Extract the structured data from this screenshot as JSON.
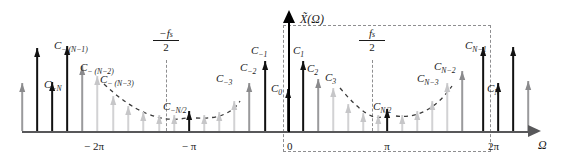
{
  "figure": {
    "type": "spectrum-line-diagram",
    "y_axis_label": "X̃(Ω)",
    "x_axis_label": "Ω"
  },
  "axis": {
    "x_ticks": [
      {
        "name": "minus-two-pi",
        "label": "− 2π",
        "x": 94
      },
      {
        "name": "minus-pi",
        "label": "− π",
        "x": 189
      },
      {
        "name": "zero",
        "label": "0",
        "x": 288
      },
      {
        "name": "pi",
        "label": "π",
        "x": 387
      },
      {
        "name": "two-pi",
        "label": "2π",
        "x": 489
      }
    ]
  },
  "markers": {
    "neg_fs_half": {
      "numerator": "−f",
      "numerator_sub": "s",
      "denominator": "2",
      "x": 166,
      "label": "-fs/2"
    },
    "pos_fs_half": {
      "numerator": "f",
      "numerator_sub": "s",
      "denominator": "2",
      "x": 372,
      "label": "fs/2"
    }
  },
  "chart_data": {
    "type": "bar",
    "title": "",
    "xlabel": "Ω",
    "ylabel": "X̃(Ω)",
    "grid": false,
    "legend": null,
    "xlim": [
      -2.6,
      2.45
    ],
    "note": "Heights are impulse amplitudes in pixels above the frequency axis; shade denotes drawing emphasis (dark = labelled line, light = faded line).",
    "impulses": [
      {
        "x": 22,
        "h": 48,
        "shade": "mid",
        "label": ""
      },
      {
        "x": 37,
        "h": 83,
        "shade": "dark",
        "label": ""
      },
      {
        "x": 52,
        "h": 49,
        "shade": "dark",
        "label": "C₋ₙ",
        "label_text": "C",
        "label_sub": "−N"
      },
      {
        "x": 67,
        "h": 85,
        "shade": "dark",
        "label": "C−(N−1)",
        "label_text": "C",
        "label_sub": "− (N−1)"
      },
      {
        "x": 82,
        "h": 65,
        "shade": "mid",
        "label": "C−(N−2)",
        "label_text": "C",
        "label_sub": "− (N−2)"
      },
      {
        "x": 97,
        "h": 55,
        "shade": "light",
        "label": "C−(N−3)",
        "label_text": "C",
        "label_sub": "− (N−3)"
      },
      {
        "x": 113,
        "h": 35,
        "shade": "light",
        "label": ""
      },
      {
        "x": 128,
        "h": 25,
        "shade": "light",
        "label": ""
      },
      {
        "x": 143,
        "h": 19,
        "shade": "light",
        "label": ""
      },
      {
        "x": 159,
        "h": 16,
        "shade": "light",
        "label": ""
      },
      {
        "x": 174,
        "h": 16,
        "shade": "light",
        "label": ""
      },
      {
        "x": 189,
        "h": 20,
        "shade": "dark",
        "label": "C−N/2",
        "label_text": "C",
        "label_sub": "−N/2"
      },
      {
        "x": 204,
        "h": 16,
        "shade": "light",
        "label": ""
      },
      {
        "x": 219,
        "h": 19,
        "shade": "light",
        "label": ""
      },
      {
        "x": 234,
        "h": 30,
        "shade": "light",
        "label": "C−3",
        "label_text": "C",
        "label_sub": "−3"
      },
      {
        "x": 249,
        "h": 48,
        "shade": "mid",
        "label": "C−2",
        "label_text": "C",
        "label_sub": "−2"
      },
      {
        "x": 265,
        "h": 70,
        "shade": "dark",
        "label": "C−1",
        "label_text": "C",
        "label_sub": "−1"
      },
      {
        "x": 288,
        "h": 42,
        "shade": "dark",
        "label": "C₀",
        "label_text": "C",
        "label_sub": "0"
      },
      {
        "x": 303,
        "h": 70,
        "shade": "dark",
        "label": "C₁",
        "label_text": "C",
        "label_sub": "1"
      },
      {
        "x": 318,
        "h": 52,
        "shade": "mid",
        "label": "C₂",
        "label_text": "C",
        "label_sub": "2"
      },
      {
        "x": 333,
        "h": 43,
        "shade": "light",
        "label": "C₃",
        "label_text": "C",
        "label_sub": "3"
      },
      {
        "x": 348,
        "h": 27,
        "shade": "light",
        "label": ""
      },
      {
        "x": 363,
        "h": 18,
        "shade": "light",
        "label": ""
      },
      {
        "x": 378,
        "h": 16,
        "shade": "light",
        "label": ""
      },
      {
        "x": 387,
        "h": 22,
        "shade": "dark",
        "label": "C N/2",
        "label_text": "C",
        "label_sub": "N/2"
      },
      {
        "x": 402,
        "h": 16,
        "shade": "light",
        "label": ""
      },
      {
        "x": 417,
        "h": 20,
        "shade": "light",
        "label": ""
      },
      {
        "x": 432,
        "h": 30,
        "shade": "light",
        "label": ""
      },
      {
        "x": 447,
        "h": 48,
        "shade": "light",
        "label": "C N−3",
        "label_text": "C",
        "label_sub": "N−3"
      },
      {
        "x": 462,
        "h": 60,
        "shade": "mid",
        "label": "C N−2",
        "label_text": "C",
        "label_sub": "N−2"
      },
      {
        "x": 483,
        "h": 84,
        "shade": "dark",
        "label": "C N−1",
        "label_text": "C",
        "label_sub": "N−1"
      },
      {
        "x": 498,
        "h": 48,
        "shade": "dark",
        "label": "C N",
        "label_text": "C",
        "label_sub": "N"
      },
      {
        "x": 513,
        "h": 84,
        "shade": "dark",
        "label": ""
      },
      {
        "x": 528,
        "h": 50,
        "shade": "mid",
        "label": ""
      }
    ]
  },
  "labels": [
    {
      "name": "label-c-minus-N",
      "text": "C",
      "sub": "−N",
      "x": 44,
      "y": 79
    },
    {
      "name": "label-c-minus-N-1",
      "text": "C",
      "sub": "− (N−1)",
      "x": 54,
      "y": 40
    },
    {
      "name": "label-c-minus-N-2",
      "text": "C",
      "sub": "− (N−2)",
      "x": 80,
      "y": 62
    },
    {
      "name": "label-c-minus-N-3",
      "text": "C",
      "sub": "− (N−3)",
      "x": 100,
      "y": 74
    },
    {
      "name": "label-c-minus-N-half",
      "text": "C",
      "sub": "−N/2",
      "x": 163,
      "y": 101
    },
    {
      "name": "label-c-minus-3",
      "text": "C",
      "sub": "−3",
      "x": 216,
      "y": 73
    },
    {
      "name": "label-c-minus-2",
      "text": "C",
      "sub": "−2",
      "x": 240,
      "y": 62
    },
    {
      "name": "label-c-minus-1",
      "text": "C",
      "sub": "−1",
      "x": 251,
      "y": 45
    },
    {
      "name": "label-c-0",
      "text": "C",
      "sub": "0",
      "x": 271,
      "y": 83
    },
    {
      "name": "label-c-1",
      "text": "C",
      "sub": "1",
      "x": 293,
      "y": 45
    },
    {
      "name": "label-c-2",
      "text": "C",
      "sub": "2",
      "x": 307,
      "y": 63
    },
    {
      "name": "label-c-3",
      "text": "C",
      "sub": "3",
      "x": 325,
      "y": 72
    },
    {
      "name": "label-c-N-half",
      "text": "C",
      "sub": "N/2",
      "x": 373,
      "y": 101
    },
    {
      "name": "label-c-N-3",
      "text": "C",
      "sub": "N−3",
      "x": 417,
      "y": 73
    },
    {
      "name": "label-c-N-2",
      "text": "C",
      "sub": "N−2",
      "x": 434,
      "y": 61
    },
    {
      "name": "label-c-N-1",
      "text": "C",
      "sub": "N−1",
      "x": 465,
      "y": 40
    },
    {
      "name": "label-c-N",
      "text": "C",
      "sub": "N",
      "x": 487,
      "y": 83
    }
  ]
}
